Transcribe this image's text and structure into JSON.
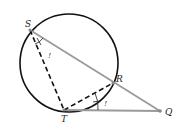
{
  "diagram": {
    "type": "geometry",
    "circle": {
      "cx": 69,
      "cy": 63,
      "r": 49,
      "stroke": "#111111"
    },
    "points": {
      "S": {
        "label": "S",
        "x": 30,
        "y": 30
      },
      "R": {
        "label": "R",
        "x": 113,
        "y": 83
      },
      "T": {
        "label": "T",
        "x": 64,
        "y": 110
      },
      "Q": {
        "label": "Q",
        "x": 160,
        "y": 111
      }
    },
    "segments": [
      {
        "from": "S",
        "to": "Q",
        "style": "solid",
        "color": "#999999"
      },
      {
        "from": "T",
        "to": "Q",
        "style": "solid",
        "color": "#999999"
      },
      {
        "from": "S",
        "to": "T",
        "style": "dashed",
        "color": "#111111"
      },
      {
        "from": "T",
        "to": "R",
        "style": "dashed",
        "color": "#111111"
      }
    ],
    "angle_marks": [
      {
        "at": "S",
        "label": "!"
      },
      {
        "at": "T",
        "label": "!"
      }
    ]
  }
}
